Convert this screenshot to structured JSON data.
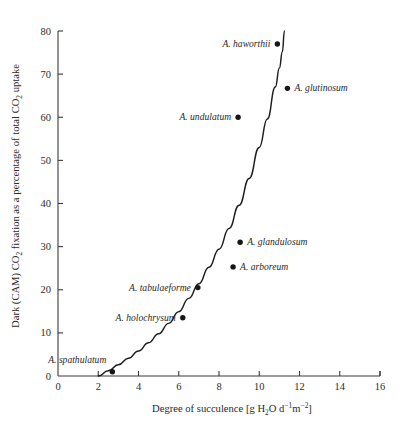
{
  "chart_data": {
    "type": "scatter",
    "title": "",
    "xlabel": "Degree of succulence [g H2O d-1 m-2]",
    "xlabel_parts": {
      "lead": "Degree of succulence [g H",
      "sub_2": "2",
      "mid": "O d",
      "sup_minus1": "−1",
      "mid2": "m",
      "sup_minus2": "−2",
      "tail": "]"
    },
    "ylabel": "Dark (CAM) CO2 fixation as a percentage of total CO2 uptake",
    "ylabel_parts": {
      "lead": "Dark (CAM) CO",
      "sub_2a": "2",
      "mid": " fixation as a percentage of total CO",
      "sub_2b": "2",
      "tail": " uptake"
    },
    "xlim": [
      0,
      16
    ],
    "ylim": [
      0,
      80
    ],
    "xticks": [
      "0",
      "2",
      "4",
      "6",
      "8",
      "10",
      "12",
      "14",
      "16"
    ],
    "xtick_values": [
      0,
      2,
      4,
      6,
      8,
      10,
      12,
      14,
      16
    ],
    "yticks": [
      "0",
      "10",
      "20",
      "30",
      "40",
      "50",
      "60",
      "70",
      "80"
    ],
    "ytick_values": [
      0,
      10,
      20,
      30,
      40,
      50,
      60,
      70,
      80
    ],
    "grid": false,
    "legend": "none",
    "marker_color": "#161616",
    "curve_color": "#1d1d1d",
    "axis_color": "#3a3a3a",
    "points": [
      {
        "name": "A. spathulatum",
        "x": 2.7,
        "y": 1.0,
        "label_side": "left",
        "label_dx": -6,
        "label_dy": -9
      },
      {
        "name": "A. holochrysum",
        "x": 6.2,
        "y": 13.5,
        "label_side": "left",
        "label_dx": -7,
        "label_dy": 3
      },
      {
        "name": "A. tabulaeforme",
        "x": 6.95,
        "y": 20.5,
        "label_side": "left",
        "label_dx": -7,
        "label_dy": 3
      },
      {
        "name": "A. arboreum",
        "x": 8.7,
        "y": 25.3,
        "label_side": "right",
        "label_dx": 7,
        "label_dy": 3
      },
      {
        "name": "A. glandulosum",
        "x": 9.05,
        "y": 31.0,
        "label_side": "right",
        "label_dx": 7,
        "label_dy": 3
      },
      {
        "name": "A. undulatum",
        "x": 8.95,
        "y": 60.0,
        "label_side": "left",
        "label_dx": -7,
        "label_dy": 3
      },
      {
        "name": "A. glutinosum",
        "x": 11.4,
        "y": 66.7,
        "label_side": "right",
        "label_dx": 7,
        "label_dy": 3
      },
      {
        "name": "A. haworthii",
        "x": 10.9,
        "y": 77.0,
        "label_side": "left",
        "label_dx": -7,
        "label_dy": 3
      }
    ],
    "fitted_curve": {
      "description": "monotonic exponential-like fit rising steeply near x=11",
      "x": [
        2.0,
        2.5,
        3.0,
        3.5,
        4.0,
        4.5,
        5.0,
        5.5,
        6.0,
        6.5,
        7.0,
        7.5,
        8.0,
        8.5,
        9.0,
        9.5,
        10.0,
        10.4,
        10.8,
        11.0,
        11.15,
        11.25
      ],
      "y": [
        0.0,
        1.2,
        2.6,
        4.1,
        5.8,
        7.7,
        9.8,
        12.2,
        14.9,
        18.0,
        21.4,
        25.2,
        29.4,
        34.2,
        39.6,
        45.8,
        53.0,
        59.6,
        67.0,
        71.4,
        75.2,
        80.0
      ]
    }
  }
}
